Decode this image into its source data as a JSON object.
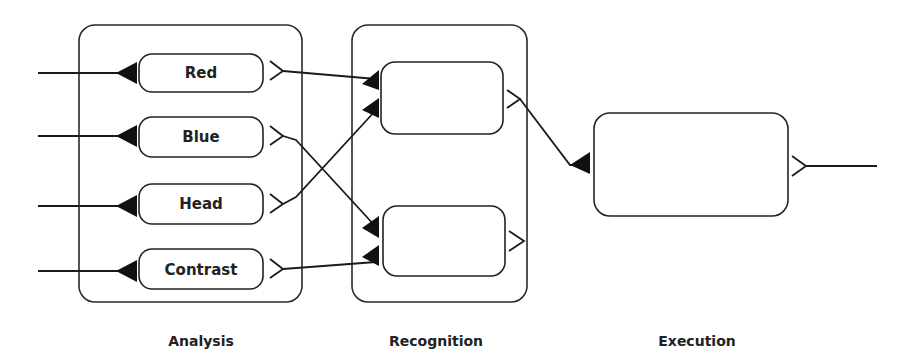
{
  "diagram": {
    "stages": [
      {
        "id": "analysis",
        "label": "Analysis"
      },
      {
        "id": "recognition",
        "label": "Recognition"
      },
      {
        "id": "execution",
        "label": "Execution"
      }
    ],
    "analysis_units": [
      {
        "id": "red",
        "label": "Red"
      },
      {
        "id": "blue",
        "label": "Blue"
      },
      {
        "id": "head",
        "label": "Head"
      },
      {
        "id": "contrast",
        "label": "Contrast"
      }
    ],
    "recognition_units": [
      {
        "id": "recognizer-1",
        "label": ""
      },
      {
        "id": "recognizer-2",
        "label": ""
      }
    ],
    "execution_units": [
      {
        "id": "executor",
        "label": ""
      }
    ],
    "connections": [
      {
        "from": "red",
        "to": "recognizer-1"
      },
      {
        "from": "head",
        "to": "recognizer-1"
      },
      {
        "from": "blue",
        "to": "recognizer-2"
      },
      {
        "from": "contrast",
        "to": "recognizer-2"
      },
      {
        "from": "recognizer-1",
        "to": "executor"
      }
    ]
  }
}
